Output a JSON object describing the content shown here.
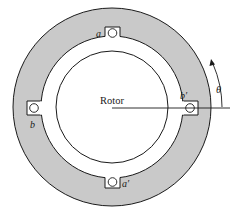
{
  "diagram": {
    "type": "cross-section",
    "colors": {
      "stator_fill": "#c9c9c9",
      "stroke": "#1a1a1a",
      "background": "#ffffff",
      "gap_fill": "#ffffff"
    },
    "labels": {
      "rotor": "Rotor",
      "slot_a": "a",
      "slot_a_prime": "a′",
      "slot_b": "b",
      "slot_b_prime": "b′",
      "angle": "θ"
    }
  }
}
